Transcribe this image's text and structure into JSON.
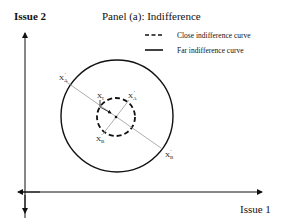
{
  "title": "Panel (a):  Indifference",
  "axes": {
    "y_label": "Issue 2",
    "x_label": "Issue 1"
  },
  "legend": [
    {
      "style": "dashed",
      "label": "Close indifference curve"
    },
    {
      "style": "solid",
      "label": "Far indifference curve"
    }
  ],
  "points": {
    "ideal": "X",
    "ideal_sub": "I",
    "xa_far": "X",
    "xa_far_sub": "A",
    "xa_close": "X",
    "xa_close_sub": "A",
    "xb_close": "X",
    "xb_close_sub": "B",
    "xb_far": "X",
    "xb_far_sub": "B",
    "prime": "'"
  },
  "colors": {
    "curve": "#111111",
    "line": "#999999"
  }
}
